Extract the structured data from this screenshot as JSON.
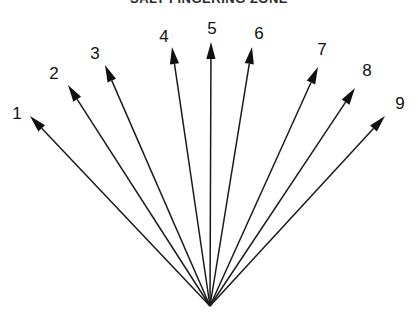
{
  "figure": {
    "title": "SALT FINGERING ZONE",
    "title_clipped": true,
    "background_color": "#ffffff",
    "stroke_color": "#1a1a1a",
    "label_color": "#111111",
    "width": 418,
    "height": 317
  },
  "chart_data": {
    "type": "diagram",
    "subtype": "radial-fan-vector-diagram",
    "title": "SALT FINGERING ZONE",
    "origin": {
      "x": 210,
      "y": 306
    },
    "arrow_count": 9,
    "arrows": [
      {
        "label": "1",
        "tip_x": 30,
        "tip_y": 116,
        "label_x": 17,
        "label_y": 113,
        "angle_deg": 133.4
      },
      {
        "label": "2",
        "tip_x": 68,
        "tip_y": 85,
        "label_x": 54,
        "label_y": 73,
        "angle_deg": 125.6
      },
      {
        "label": "3",
        "tip_x": 105,
        "tip_y": 65,
        "label_x": 95,
        "label_y": 53,
        "angle_deg": 118.1
      },
      {
        "label": "4",
        "tip_x": 172,
        "tip_y": 47,
        "label_x": 164,
        "label_y": 36,
        "angle_deg": 98.5
      },
      {
        "label": "5",
        "tip_x": 211,
        "tip_y": 42,
        "label_x": 212,
        "label_y": 28,
        "angle_deg": 89.8
      },
      {
        "label": "6",
        "tip_x": 252,
        "tip_y": 47,
        "label_x": 259,
        "label_y": 33,
        "angle_deg": 80.9
      },
      {
        "label": "7",
        "tip_x": 318,
        "tip_y": 67,
        "label_x": 322,
        "label_y": 49,
        "angle_deg": 63.4
      },
      {
        "label": "8",
        "tip_x": 355,
        "tip_y": 88,
        "label_x": 367,
        "label_y": 70,
        "angle_deg": 56.3
      },
      {
        "label": "9",
        "tip_x": 385,
        "tip_y": 116,
        "label_x": 400,
        "label_y": 103,
        "angle_deg": 48.6
      }
    ]
  }
}
